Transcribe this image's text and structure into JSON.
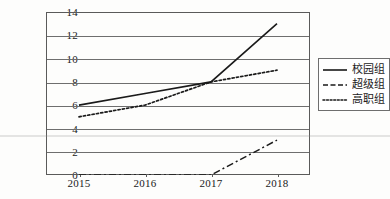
{
  "chart_data": {
    "type": "line",
    "title": "",
    "xlabel": "",
    "ylabel": "",
    "categories": [
      "2015",
      "2016",
      "2017",
      "2018"
    ],
    "x": [
      2015,
      2016,
      2017,
      2018
    ],
    "ylim": [
      0,
      14
    ],
    "y_ticks": [
      "0",
      "2",
      "4",
      "6",
      "8",
      "10",
      "12",
      "14"
    ],
    "grid": true,
    "legend_position": "right",
    "series": [
      {
        "name": "校园组",
        "style": "solid",
        "values": [
          6,
          7,
          8,
          13
        ]
      },
      {
        "name": "超级组",
        "style": "dashdot",
        "values": [
          0,
          0,
          0,
          3
        ]
      },
      {
        "name": "高职组",
        "style": "dotted",
        "values": [
          5,
          6,
          8,
          9
        ]
      }
    ]
  },
  "axes": {
    "y_tick_labels": [
      "14",
      "12",
      "10",
      "8",
      "6",
      "4",
      "2",
      "0"
    ],
    "x_tick_labels": [
      "2015",
      "2016",
      "2017",
      "2018"
    ]
  },
  "legend": {
    "entries": [
      {
        "label": "校园组",
        "style": "solid"
      },
      {
        "label": "超级组",
        "style": "dashdot"
      },
      {
        "label": "高职组",
        "style": "dotted"
      }
    ]
  },
  "colors": {
    "line": "#1a1a1a",
    "grid": "#6e6e6e",
    "frame": "#5a5a5a",
    "background": "#fdfdfc"
  }
}
